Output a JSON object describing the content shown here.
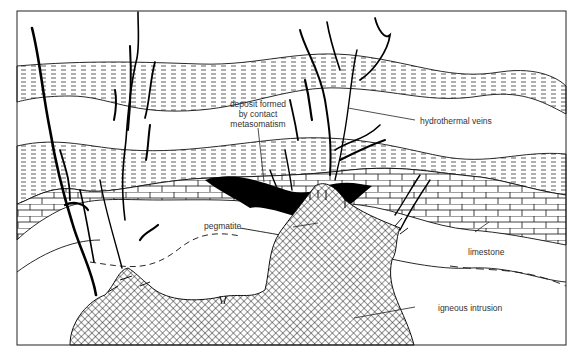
{
  "diagram": {
    "title": "",
    "labels": {
      "deposit": [
        "deposit formed",
        "by contact",
        "metasomatism"
      ],
      "hydrothermal": "hydrothermal veins",
      "pegmatite": "pegmatite",
      "limestone": "limestone",
      "igneous": "igneous intrusion"
    },
    "colors": {
      "line": "#111111",
      "vein": "#000000",
      "background": "#ffffff",
      "text": "#333333"
    }
  }
}
